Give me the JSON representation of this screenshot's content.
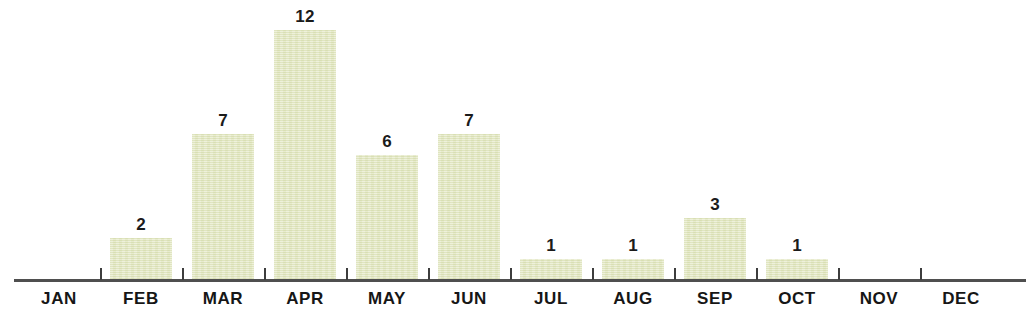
{
  "chart_data": {
    "type": "bar",
    "title": "",
    "subtitle": "",
    "xlabel": "",
    "ylabel": "",
    "categories": [
      "JAN",
      "FEB",
      "MAR",
      "APR",
      "MAY",
      "JUN",
      "JUL",
      "AUG",
      "SEP",
      "OCT",
      "NOV",
      "DEC"
    ],
    "values": [
      0,
      2,
      7,
      12,
      6,
      7,
      1,
      1,
      3,
      1,
      0,
      0
    ],
    "value_labels": [
      "",
      "2",
      "7",
      "12",
      "6",
      "7",
      "1",
      "1",
      "3",
      "1",
      "",
      ""
    ],
    "ylim": [
      0,
      13
    ],
    "grid": false,
    "legend": null,
    "annotations": [],
    "colors": {
      "bar_fill": "#e2e7bf",
      "axis_line": "#4f4f4f",
      "tick": "#3d3d3d",
      "value_label": "#1b1b1b",
      "category_label": "#161616",
      "background": "#ffffff"
    }
  }
}
